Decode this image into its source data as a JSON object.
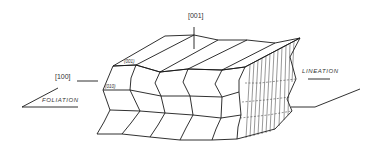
{
  "figure": {
    "labels": {
      "axis_001": "[001]",
      "axis_100": "[100]",
      "face_001": "(001)",
      "face_010": "(010)",
      "foliation": "FOLIATION",
      "lineation": "LINEATION"
    },
    "colors": {
      "line": "#1a1a1a",
      "background": "#ffffff"
    }
  }
}
